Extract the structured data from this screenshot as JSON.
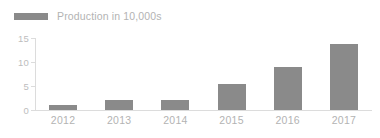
{
  "legend": {
    "swatch_icon": "legend-swatch-icon",
    "label": "Production in 10,000s",
    "color": "#8a8a8a"
  },
  "axis": {
    "y_ticks": [
      "15",
      "10",
      "5",
      "0"
    ],
    "x_labels": [
      "2012",
      "2013",
      "2014",
      "2015",
      "2016",
      "2017"
    ],
    "axis_color": "#dcdcdc",
    "tick_text_color": "#bdbdbd"
  },
  "chart_data": {
    "type": "bar",
    "title": "",
    "subtitle": "",
    "xlabel": "",
    "ylabel": "",
    "categories": [
      "2012",
      "2013",
      "2014",
      "2015",
      "2016",
      "2017"
    ],
    "values": [
      1,
      2,
      2.1,
      5.5,
      9,
      13.7
    ],
    "series": [
      {
        "name": "Production in 10,000s",
        "values": [
          1,
          2,
          2.1,
          5.5,
          9,
          13.7
        ],
        "color": "#8a8a8a"
      }
    ],
    "ylim": [
      0,
      15
    ],
    "yticks": [
      0,
      5,
      10,
      15
    ],
    "grid": false,
    "legend_position": "top-left",
    "bar_color": "#8a8a8a",
    "background": "#ffffff"
  }
}
